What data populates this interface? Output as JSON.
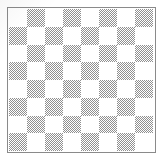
{
  "figure": {
    "background_color": "#ffffff",
    "border_color": "#8a8a8a",
    "light_square_color": "#ffffff",
    "dark_square_color": "#8f8f8f",
    "rows": 8,
    "columns": 8,
    "top_left_square": "light"
  },
  "chart_data": {
    "type": "heatmap",
    "xlabel": "",
    "ylabel": "",
    "categories": [
      "1",
      "2",
      "3",
      "4",
      "5",
      "6",
      "7",
      "8"
    ],
    "row_labels": [
      "1",
      "2",
      "3",
      "4",
      "5",
      "6",
      "7",
      "8"
    ],
    "legend": [],
    "grid": false,
    "values": [
      [
        0,
        1,
        0,
        1,
        0,
        1,
        0,
        1
      ],
      [
        1,
        0,
        1,
        0,
        1,
        0,
        1,
        0
      ],
      [
        0,
        1,
        0,
        1,
        0,
        1,
        0,
        1
      ],
      [
        1,
        0,
        1,
        0,
        1,
        0,
        1,
        0
      ],
      [
        0,
        1,
        0,
        1,
        0,
        1,
        0,
        1
      ],
      [
        1,
        0,
        1,
        0,
        1,
        0,
        1,
        0
      ],
      [
        0,
        1,
        0,
        1,
        0,
        1,
        0,
        1
      ],
      [
        1,
        0,
        1,
        0,
        1,
        0,
        1,
        0
      ]
    ],
    "value_map": {
      "0": "light",
      "1": "dark"
    },
    "colors": {
      "0": "#ffffff",
      "1": "#8f8f8f"
    }
  }
}
